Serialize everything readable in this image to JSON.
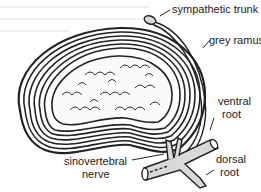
{
  "diagram": {
    "labels": {
      "sympathetic_trunk": "sympathetic trunk",
      "grey_ramus": "grey ramus",
      "ventral_root_line1": "ventral",
      "ventral_root_line2": "root",
      "dorsal_root_line1": "dorsal",
      "dorsal_root_line2": "root",
      "sinovertebral_line1": "sinovertebral",
      "sinovertebral_line2": "nerve"
    },
    "colors": {
      "ink": "#222222",
      "nerve_fill": "#d9d9d9",
      "background": "#ffffff",
      "bleed_text": "#f1f1f1"
    },
    "structures": [
      "annulus fibrosus lamellae",
      "nucleus pulposus",
      "spinal nerve",
      "sympathetic trunk",
      "grey ramus",
      "ventral root",
      "dorsal root",
      "sinovertebral nerve"
    ]
  }
}
